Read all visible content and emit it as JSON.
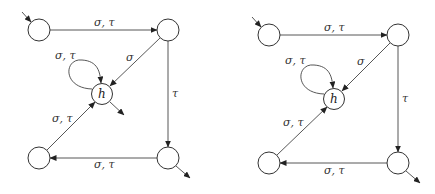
{
  "diagrams": [
    {
      "id": "left",
      "states": {
        "q0": {
          "cx": 39,
          "cy": 30,
          "label": ""
        },
        "q1": {
          "cx": 168,
          "cy": 30,
          "label": ""
        },
        "h": {
          "cx": 102,
          "cy": 94,
          "label": "h"
        },
        "q2": {
          "cx": 39,
          "cy": 158,
          "label": ""
        },
        "q3": {
          "cx": 168,
          "cy": 158,
          "label": ""
        }
      },
      "labels": {
        "q0_q1": "σ, τ",
        "q1_h": "σ",
        "h_loop": "σ, τ",
        "q1_q3": "τ",
        "q3_q2": "σ, τ",
        "q2_h": "σ, τ"
      },
      "initial": "q0",
      "final": [
        "h",
        "q3"
      ]
    },
    {
      "id": "right",
      "states": {
        "q0": {
          "cx": 269,
          "cy": 35,
          "label": ""
        },
        "q1": {
          "cx": 398,
          "cy": 35,
          "label": ""
        },
        "h": {
          "cx": 334,
          "cy": 99,
          "label": "h"
        },
        "q2": {
          "cx": 269,
          "cy": 163,
          "label": ""
        },
        "q3": {
          "cx": 398,
          "cy": 163,
          "label": ""
        }
      },
      "labels": {
        "q0_q1": "σ, τ",
        "q1_h": "σ",
        "h_loop": "σ, τ",
        "q1_q3": "τ",
        "q3_q2": "σ, τ",
        "q2_h": "σ, τ"
      },
      "initial": "q0",
      "final": [
        "q3"
      ]
    }
  ]
}
